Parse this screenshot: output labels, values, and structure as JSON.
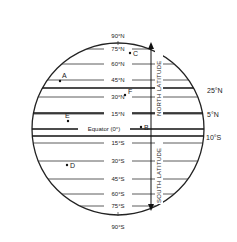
{
  "diagram": {
    "latitude_labels": {
      "n90": "90°N",
      "n75": "75°N",
      "n60": "60°N",
      "n45": "45°N",
      "n30": "30°N",
      "n15": "15°N",
      "equator": "Equator (0°)",
      "s15": "15°S",
      "s30": "30°S",
      "s45": "45°S",
      "s60": "60°S",
      "s75": "75°S",
      "s90": "90°S"
    },
    "side_labels": {
      "n25": "25°N",
      "n5": "5°N",
      "s10": "10°S"
    },
    "axis_labels": {
      "north": "NORTH LATITUDE",
      "south": "SOUTH LATITUDE"
    },
    "points": {
      "A": "A",
      "B": "B",
      "C": "C",
      "D": "D",
      "E": "E",
      "F": "F"
    }
  }
}
